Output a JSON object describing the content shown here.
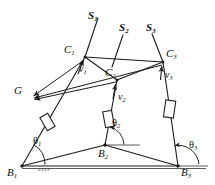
{
  "figure": {
    "background_color": "#ffffff",
    "line_color": "#1a1a1a",
    "ground_line_color": "#555555",
    "width": 215,
    "height": 185
  },
  "labels": {
    "screw_axes": [
      {
        "name": "screw-axis-1",
        "base": "S",
        "sub": "1",
        "x": 88,
        "y": 10
      },
      {
        "name": "screw-axis-2",
        "base": "S",
        "sub": "2",
        "x": 119,
        "y": 22
      },
      {
        "name": "screw-axis-3",
        "base": "S",
        "sub": "3",
        "x": 146,
        "y": 22
      }
    ],
    "coupler_points": [
      {
        "name": "coupler-point-1",
        "base": "C",
        "sub": "1",
        "x": 64,
        "y": 44
      },
      {
        "name": "coupler-point-2",
        "base": "C",
        "sub": "2",
        "x": 105,
        "y": 71
      },
      {
        "name": "coupler-point-3",
        "base": "C",
        "sub": "3",
        "x": 166,
        "y": 50
      }
    ],
    "velocity_vectors": [
      {
        "name": "velocity-vector-1",
        "base": "v",
        "sub": "1",
        "x": 79,
        "y": 65
      },
      {
        "name": "velocity-vector-2",
        "base": "v",
        "sub": "2",
        "x": 117,
        "y": 93
      },
      {
        "name": "velocity-vector-3",
        "base": "v",
        "sub": "3",
        "x": 164,
        "y": 72
      },
      {
        "name": "velocity-vector-g",
        "base": "G",
        "sub": "",
        "x": 14,
        "y": 86
      }
    ],
    "base_points": [
      {
        "name": "base-point-1",
        "base": "B",
        "sub": "1",
        "x": 8,
        "y": 167
      },
      {
        "name": "base-point-2",
        "base": "B",
        "sub": "2",
        "x": 98,
        "y": 149
      },
      {
        "name": "base-point-3",
        "base": "B",
        "sub": "3",
        "x": 180,
        "y": 167
      }
    ],
    "angles": [
      {
        "name": "angle-theta-1",
        "base": "θ",
        "sub": "1",
        "x": 33,
        "y": 137
      },
      {
        "name": "angle-theta-2",
        "base": "θ",
        "sub": "2",
        "x": 112,
        "y": 119
      },
      {
        "name": "angle-theta-3",
        "base": "θ",
        "sub": "3",
        "x": 189,
        "y": 141
      }
    ]
  },
  "geometry": {
    "points": {
      "B1": [
        22,
        166
      ],
      "B2": [
        105,
        145
      ],
      "B3": [
        178,
        166
      ],
      "C1": [
        85,
        57
      ],
      "C2": [
        117,
        80
      ],
      "C3": [
        163,
        62
      ],
      "G": [
        31,
        97
      ],
      "S1_top": [
        97,
        17
      ],
      "S2_top": [
        121,
        34
      ],
      "S3_top": [
        150,
        34
      ],
      "S2_bot": [
        104,
        68
      ],
      "S3_bot": [
        164,
        60
      ]
    },
    "legs": [
      {
        "name": "leg-1",
        "from": "B1",
        "to": "S1_top",
        "slider_t": 0.46
      },
      {
        "name": "leg-2",
        "from": "B2",
        "to": "S2_top",
        "slider_t": 0.38
      },
      {
        "name": "leg-3",
        "from": "B3",
        "to": "S3_top",
        "slider_t": 0.44
      }
    ],
    "platform_edges": [
      {
        "name": "platform-edge-c1-c2",
        "from": "C1",
        "to": "C2"
      },
      {
        "name": "platform-edge-c2-c3",
        "from": "C2",
        "to": "C3"
      },
      {
        "name": "platform-edge-c1-c3",
        "from": "C1",
        "to": "C3"
      }
    ],
    "base_edges": [
      {
        "name": "base-edge-b1-b2",
        "from": "B1",
        "to": "B2"
      },
      {
        "name": "base-edge-b2-b3",
        "from": "B2",
        "to": "B3"
      },
      {
        "name": "base-edge-b1-b3",
        "from": "B1",
        "to": "B3"
      }
    ],
    "g_arrows": [
      {
        "name": "g-arrow-from-c1",
        "from": "C1",
        "to": "G"
      },
      {
        "name": "g-arrow-from-c3",
        "from": "C3",
        "to": "G"
      }
    ],
    "velocity_arrows": [
      {
        "name": "v1-arrow",
        "at": "C1",
        "dx": -4,
        "dy": 16
      },
      {
        "name": "v2-arrow",
        "at": "C2",
        "dx": -3,
        "dy": 18
      },
      {
        "name": "v3-arrow",
        "at": "C3",
        "dx": 0,
        "dy": 17
      }
    ]
  }
}
